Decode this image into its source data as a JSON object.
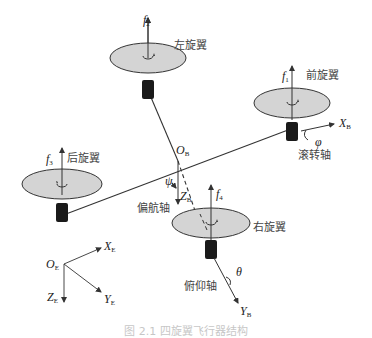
{
  "diagram": {
    "title": "四旋翼飞行器结构",
    "rotors": [
      {
        "id": "left",
        "label": "左旋翼",
        "force": "f",
        "force_sub": "2"
      },
      {
        "id": "front",
        "label": "前旋翼",
        "force": "f",
        "force_sub": "1"
      },
      {
        "id": "rear",
        "label": "后旋翼",
        "force": "f",
        "force_sub": "3"
      },
      {
        "id": "right",
        "label": "右旋翼",
        "force": "f",
        "force_sub": "4"
      }
    ],
    "body_frame": {
      "origin": "O",
      "origin_sub": "B",
      "x_axis": "X",
      "x_sub": "B",
      "y_axis": "Y",
      "y_sub": "B",
      "z_axis": "Z",
      "z_sub": "B"
    },
    "earth_frame": {
      "origin": "O",
      "origin_sub": "E",
      "x_axis": "X",
      "x_sub": "E",
      "y_axis": "Y",
      "y_sub": "E",
      "z_axis": "Z",
      "z_sub": "E"
    },
    "axes_labels": {
      "roll": "滚转轴",
      "yaw": "偏航轴",
      "pitch": "俯仰轴"
    },
    "angles": {
      "roll": "φ",
      "yaw": "ψ",
      "pitch": "θ"
    },
    "caption": "图 2.1  四旋翼飞行器结构"
  },
  "colors": {
    "rotor_fill": "#d4d4d4",
    "rotor_stroke": "#333333",
    "motor": "#1a1a1a",
    "line": "#333333"
  }
}
